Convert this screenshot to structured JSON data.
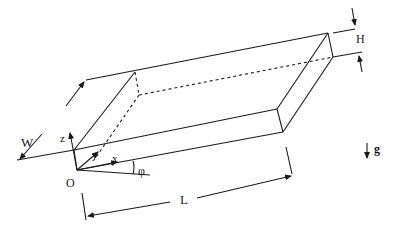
{
  "diagram": {
    "labels": {
      "width": "W",
      "height": "H",
      "length": "L",
      "z_axis": "z",
      "y_axis": "y",
      "x_axis": "x",
      "origin": "O",
      "angle": "φ",
      "gravity": "g"
    },
    "colors": {
      "line": "#1a1a1a",
      "background": "#ffffff"
    }
  }
}
